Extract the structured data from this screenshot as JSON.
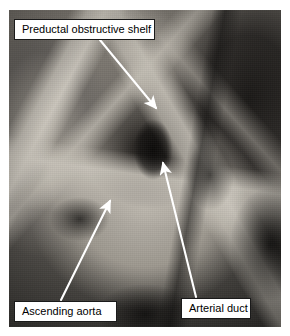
{
  "figure": {
    "kind": "anatomical-dissection-photograph",
    "rendering": "grayscale"
  },
  "annotations": [
    {
      "id": "preductal-obstructive-shelf",
      "label": "Preductal obstructive shelf",
      "box": {
        "x": 14,
        "y": 19,
        "w": 141,
        "h": 21
      },
      "leader": {
        "x1": 100,
        "y1": 40,
        "x2": 156,
        "y2": 108
      },
      "arrow": "end"
    },
    {
      "id": "ascending-aorta",
      "label": "Ascending aorta",
      "box": {
        "x": 14,
        "y": 301,
        "w": 103,
        "h": 21
      },
      "leader": {
        "x1": 61,
        "y1": 300,
        "x2": 110,
        "y2": 201
      },
      "arrow": "end"
    },
    {
      "id": "arterial-duct",
      "label": "Arterial duct",
      "box": {
        "x": 181,
        "y": 298,
        "w": 70,
        "h": 21
      },
      "leader": {
        "x1": 196,
        "y1": 297,
        "x2": 163,
        "y2": 163
      },
      "arrow": "end"
    }
  ],
  "colors": {
    "leader_line": "#ffffff",
    "label_background": "#ffffff",
    "label_border": "#1a1a1a",
    "label_text": "#000000",
    "page_background": "#ffffff"
  }
}
